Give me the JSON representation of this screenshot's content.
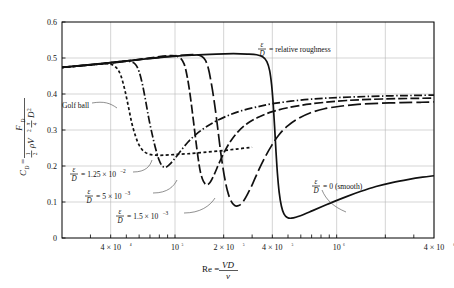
{
  "chart_data": {
    "type": "line",
    "title": "",
    "xlabel": "Re = VD/ν",
    "ylabel": "C_D = F_D / (½ ρ V² (π/4) D²)",
    "xscale": "log",
    "yscale": "linear",
    "xlim": [
      20000,
      4000000
    ],
    "ylim": [
      0,
      0.6
    ],
    "grid": true,
    "legend_position": "inline-annotations",
    "xticks": [
      {
        "value": 40000,
        "label": "4 × 10⁴"
      },
      {
        "value": 100000,
        "label": "10⁵"
      },
      {
        "value": 200000,
        "label": "2 × 10⁵"
      },
      {
        "value": 400000,
        "label": "4 × 10⁵"
      },
      {
        "value": 1000000,
        "label": "10⁶"
      },
      {
        "value": 4000000,
        "label": "4 × 10⁶"
      }
    ],
    "xgrid_values": [
      40000,
      100000,
      200000,
      400000,
      1000000,
      2000000,
      4000000
    ],
    "yticks": [
      {
        "value": 0.0,
        "label": "0"
      },
      {
        "value": 0.1,
        "label": "0.1"
      },
      {
        "value": 0.2,
        "label": "0.2"
      },
      {
        "value": 0.3,
        "label": "0.3"
      },
      {
        "value": 0.4,
        "label": "0.4"
      },
      {
        "value": 0.5,
        "label": "0.5"
      },
      {
        "value": 0.6,
        "label": "0.6"
      }
    ],
    "series": [
      {
        "name": "golf-ball",
        "label": "Golf ball",
        "dash": "3,2.4",
        "points": [
          [
            20000,
            0.474
          ],
          [
            26000,
            0.478
          ],
          [
            32000,
            0.482
          ],
          [
            38000,
            0.484
          ],
          [
            41000,
            0.481
          ],
          [
            44000,
            0.47
          ],
          [
            46500,
            0.448
          ],
          [
            49000,
            0.41
          ],
          [
            51500,
            0.365
          ],
          [
            54000,
            0.32
          ],
          [
            57000,
            0.283
          ],
          [
            60000,
            0.258
          ],
          [
            64000,
            0.241
          ],
          [
            69000,
            0.233
          ],
          [
            76000,
            0.23
          ],
          [
            85000,
            0.23
          ],
          [
            100000,
            0.232
          ],
          [
            120000,
            0.234
          ],
          [
            150000,
            0.238
          ],
          [
            190000,
            0.242
          ],
          [
            240000,
            0.247
          ],
          [
            300000,
            0.252
          ]
        ]
      },
      {
        "name": "roughness-1p25e-2",
        "label": "ε/D = 1.25 × 10⁻²",
        "dash": "8,2.4,1.4,2.4",
        "points": [
          [
            20000,
            0.474
          ],
          [
            30000,
            0.481
          ],
          [
            40000,
            0.487
          ],
          [
            48000,
            0.491
          ],
          [
            53000,
            0.49
          ],
          [
            57000,
            0.482
          ],
          [
            60000,
            0.462
          ],
          [
            63000,
            0.425
          ],
          [
            66000,
            0.378
          ],
          [
            69000,
            0.33
          ],
          [
            72500,
            0.285
          ],
          [
            76000,
            0.247
          ],
          [
            79500,
            0.218
          ],
          [
            83000,
            0.201
          ],
          [
            87000,
            0.196
          ],
          [
            92000,
            0.203
          ],
          [
            99000,
            0.219
          ],
          [
            108000,
            0.241
          ],
          [
            120000,
            0.266
          ],
          [
            135000,
            0.288
          ],
          [
            155000,
            0.308
          ],
          [
            180000,
            0.325
          ],
          [
            215000,
            0.341
          ],
          [
            260000,
            0.354
          ],
          [
            320000,
            0.364
          ],
          [
            400000,
            0.373
          ],
          [
            520000,
            0.38
          ],
          [
            700000,
            0.386
          ],
          [
            1000000,
            0.39
          ],
          [
            1500000,
            0.393
          ],
          [
            2200000,
            0.395
          ],
          [
            3000000,
            0.396
          ],
          [
            4000000,
            0.397
          ]
        ]
      },
      {
        "name": "roughness-5e-3",
        "label": "ε/D = 5 × 10⁻³",
        "dash": "9,3",
        "points": [
          [
            20000,
            0.474
          ],
          [
            35000,
            0.484
          ],
          [
            55000,
            0.494
          ],
          [
            75000,
            0.502
          ],
          [
            90000,
            0.506
          ],
          [
            100000,
            0.506
          ],
          [
            108000,
            0.5
          ],
          [
            114000,
            0.483
          ],
          [
            119000,
            0.448
          ],
          [
            124000,
            0.398
          ],
          [
            129000,
            0.338
          ],
          [
            134000,
            0.277
          ],
          [
            139000,
            0.222
          ],
          [
            144000,
            0.181
          ],
          [
            150000,
            0.157
          ],
          [
            157000,
            0.148
          ],
          [
            165000,
            0.155
          ],
          [
            175000,
            0.177
          ],
          [
            187000,
            0.207
          ],
          [
            202000,
            0.239
          ],
          [
            220000,
            0.268
          ],
          [
            245000,
            0.295
          ],
          [
            280000,
            0.318
          ],
          [
            330000,
            0.336
          ],
          [
            400000,
            0.351
          ],
          [
            500000,
            0.362
          ],
          [
            650000,
            0.371
          ],
          [
            850000,
            0.377
          ],
          [
            1150000,
            0.382
          ],
          [
            1600000,
            0.385
          ],
          [
            2300000,
            0.387
          ],
          [
            3200000,
            0.388
          ],
          [
            4000000,
            0.389
          ]
        ]
      },
      {
        "name": "roughness-1p5e-3",
        "label": "ε/D = 1.5 × 10⁻³",
        "dash": "13,4",
        "points": [
          [
            20000,
            0.474
          ],
          [
            40000,
            0.486
          ],
          [
            70000,
            0.499
          ],
          [
            100000,
            0.506
          ],
          [
            120000,
            0.509
          ],
          [
            135000,
            0.509
          ],
          [
            146000,
            0.505
          ],
          [
            154000,
            0.494
          ],
          [
            161000,
            0.47
          ],
          [
            168000,
            0.428
          ],
          [
            176000,
            0.37
          ],
          [
            184000,
            0.303
          ],
          [
            192000,
            0.236
          ],
          [
            201000,
            0.177
          ],
          [
            211000,
            0.131
          ],
          [
            222000,
            0.103
          ],
          [
            234000,
            0.09
          ],
          [
            248000,
            0.09
          ],
          [
            264000,
            0.101
          ],
          [
            282000,
            0.123
          ],
          [
            303000,
            0.152
          ],
          [
            328000,
            0.187
          ],
          [
            358000,
            0.222
          ],
          [
            395000,
            0.256
          ],
          [
            440000,
            0.287
          ],
          [
            500000,
            0.312
          ],
          [
            580000,
            0.332
          ],
          [
            690000,
            0.348
          ],
          [
            840000,
            0.359
          ],
          [
            1050000,
            0.366
          ],
          [
            1350000,
            0.371
          ],
          [
            1800000,
            0.374
          ],
          [
            2500000,
            0.376
          ],
          [
            3300000,
            0.377
          ],
          [
            4000000,
            0.378
          ]
        ]
      },
      {
        "name": "smooth",
        "label": "ε/D = 0 (smooth)",
        "dash": "none",
        "points": [
          [
            20000,
            0.474
          ],
          [
            40000,
            0.487
          ],
          [
            80000,
            0.501
          ],
          [
            130000,
            0.508
          ],
          [
            180000,
            0.511
          ],
          [
            230000,
            0.512
          ],
          [
            280000,
            0.511
          ],
          [
            320000,
            0.509
          ],
          [
            350000,
            0.503
          ],
          [
            370000,
            0.49
          ],
          [
            385000,
            0.465
          ],
          [
            396000,
            0.425
          ],
          [
            405000,
            0.372
          ],
          [
            413000,
            0.31
          ],
          [
            421000,
            0.243
          ],
          [
            430000,
            0.18
          ],
          [
            441000,
            0.127
          ],
          [
            455000,
            0.089
          ],
          [
            472000,
            0.067
          ],
          [
            495000,
            0.057
          ],
          [
            525000,
            0.055
          ],
          [
            570000,
            0.059
          ],
          [
            630000,
            0.066
          ],
          [
            710000,
            0.076
          ],
          [
            820000,
            0.088
          ],
          [
            960000,
            0.101
          ],
          [
            1150000,
            0.115
          ],
          [
            1400000,
            0.129
          ],
          [
            1750000,
            0.143
          ],
          [
            2200000,
            0.154
          ],
          [
            2800000,
            0.163
          ],
          [
            3400000,
            0.169
          ],
          [
            4000000,
            0.173
          ]
        ]
      }
    ],
    "annotations": [
      {
        "name": "relative-roughness-note",
        "text": "= relative roughness",
        "frac_num": "ε",
        "frac_den": "D",
        "x": 258,
        "y": 49
      },
      {
        "name": "golf-ball-note",
        "text": "Golf ball",
        "x": 62,
        "y": 105
      },
      {
        "name": "roughness-1p25e-2-note",
        "text": "= 1.25 × 10",
        "sup": "−2",
        "frac_num": "ε",
        "frac_den": "D",
        "x": 70,
        "y": 174
      },
      {
        "name": "roughness-5e-3-note",
        "text": "= 5 × 10",
        "sup": "−3",
        "frac_num": "ε",
        "frac_den": "D",
        "x": 85,
        "y": 196
      },
      {
        "name": "roughness-1p5e-3-note",
        "text": "= 1.5 × 10",
        "sup": "−3",
        "frac_num": "ε",
        "frac_den": "D",
        "x": 116,
        "y": 216
      },
      {
        "name": "smooth-note",
        "text": "= 0 (smooth)",
        "frac_num": "ε",
        "frac_den": "D",
        "x": 312,
        "y": 186
      }
    ],
    "axis_titles": {
      "x_prefix": "Re =",
      "x_num": "VD",
      "x_den": "ν",
      "y_lhs": "C",
      "y_lhs_sub": "D",
      "y_eq": "=",
      "y_num": "F",
      "y_num_sub": "D",
      "y_den_half_num": "1",
      "y_den_half_den": "2",
      "y_den_rho": "ρV",
      "y_den_rho_sup": "2",
      "y_den_pi_num": "π",
      "y_den_pi_den": "4",
      "y_den_d": "D",
      "y_den_d_sup": "2"
    }
  },
  "colors": {
    "curve": "#111111",
    "grid": "#b9b9b9",
    "axis": "#000000",
    "background": "#ffffff"
  }
}
